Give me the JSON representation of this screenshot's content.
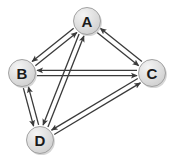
{
  "figure": {
    "type": "directed-graph",
    "background_color": "#ffffff",
    "width": 174,
    "height": 162
  },
  "style": {
    "node_fill": "#dcdcdc",
    "node_fill_highlight": "#f0f0f0",
    "node_stroke": "#9a9a9a",
    "node_radius": 13.5,
    "label_color": "#1a1a1a",
    "edge_color": "#3a3a3a",
    "edge_width": 1.3,
    "arrow_color": "#3a3a3a",
    "shadow_color": "#b4b4b4"
  },
  "nodes": [
    {
      "id": "A",
      "label": "A",
      "x": 87,
      "y": 21
    },
    {
      "id": "B",
      "label": "B",
      "x": 22,
      "y": 73
    },
    {
      "id": "C",
      "label": "C",
      "x": 152,
      "y": 73
    },
    {
      "id": "D",
      "label": "D",
      "x": 40,
      "y": 140
    }
  ],
  "edges": [
    {
      "id": "A-B",
      "from": "A",
      "to": "B",
      "directed": "both",
      "label": ""
    },
    {
      "id": "A-C",
      "from": "A",
      "to": "C",
      "directed": "both",
      "label": ""
    },
    {
      "id": "A-D",
      "from": "A",
      "to": "D",
      "directed": "both",
      "label": ""
    },
    {
      "id": "B-C",
      "from": "B",
      "to": "C",
      "directed": "both",
      "label": ""
    },
    {
      "id": "B-D",
      "from": "B",
      "to": "D",
      "directed": "both",
      "label": ""
    },
    {
      "id": "C-D",
      "from": "C",
      "to": "D",
      "directed": "both",
      "label": ""
    }
  ]
}
